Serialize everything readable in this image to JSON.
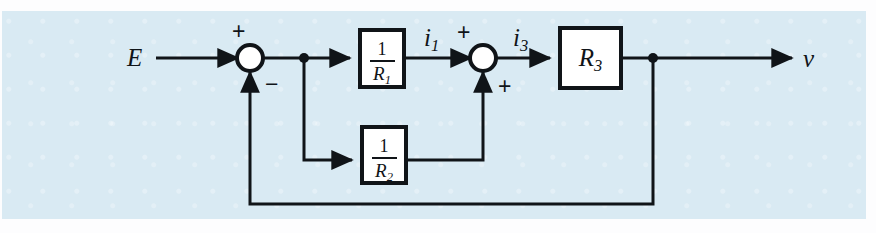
{
  "figure": {
    "kind": "control-system-block-diagram",
    "background_color": "#d9eaf3",
    "line_color": "#101418",
    "block_fill": "#ffffff"
  },
  "labels": {
    "input": "E",
    "output": "v",
    "signal_i1": "i",
    "signal_i1_sub": "1",
    "signal_i3": "i",
    "signal_i3_sub": "3",
    "sum1_plus": "+",
    "sum1_minus": "−",
    "sum2_plus_top": "+",
    "sum2_plus_bottom": "+"
  },
  "blocks": [
    {
      "name": "block-inv-r1",
      "numerator": "1",
      "denominator": "R",
      "denominator_sub": "1",
      "x": 360,
      "y": 30,
      "w": 44,
      "h": 57
    },
    {
      "name": "block-inv-r2",
      "numerator": "1",
      "denominator": "R",
      "denominator_sub": "2",
      "x": 362,
      "y": 127,
      "w": 44,
      "h": 56
    },
    {
      "name": "block-r3",
      "label": "R",
      "label_sub": "3",
      "x": 560,
      "y": 28,
      "w": 61,
      "h": 60
    }
  ],
  "junctions": [
    {
      "name": "summing-junction-1",
      "cx": 250,
      "cy": 58,
      "r": 13
    },
    {
      "name": "summing-junction-2",
      "cx": 483,
      "cy": 58,
      "r": 13
    }
  ],
  "nodes": [
    {
      "name": "branch-node-after-sum1",
      "cx": 304,
      "cy": 58,
      "r": 4
    },
    {
      "name": "branch-node-output",
      "cx": 653,
      "cy": 58,
      "r": 4
    }
  ]
}
